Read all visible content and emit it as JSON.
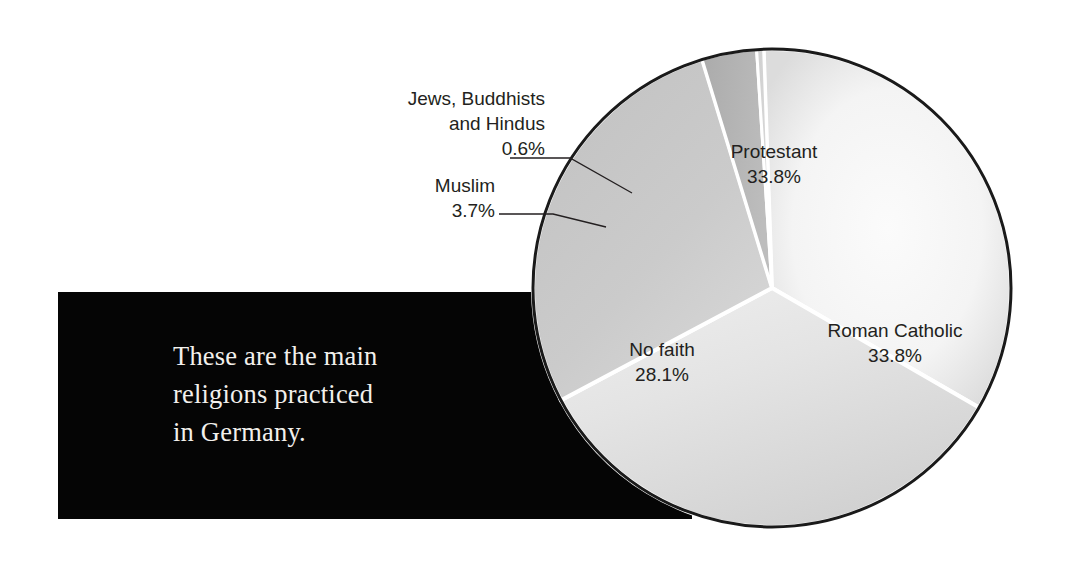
{
  "caption": {
    "line1": "These are the main",
    "line2": "religions practiced",
    "line3": "in Germany."
  },
  "chart_data": {
    "type": "pie",
    "title": "",
    "unit": "%",
    "categories": [
      "Protestant",
      "Roman Catholic",
      "No faith",
      "Muslim",
      "Jews, Buddhists and Hindus"
    ],
    "values": [
      33.8,
      33.8,
      28.1,
      3.7,
      0.6
    ],
    "legend": "none",
    "labels_inline": true,
    "slices": [
      {
        "name": "Protestant",
        "label": "Protestant",
        "value": 33.8,
        "value_text": "33.8%",
        "color": "#f3f3f3",
        "start_angle": -92,
        "end_angle": 30,
        "label_placement": "inside"
      },
      {
        "name": "Roman Catholic",
        "label": "Roman Catholic",
        "value": 33.8,
        "value_text": "33.8%",
        "color": "#e2e2e2",
        "start_angle": 30,
        "end_angle": 152,
        "label_placement": "inside"
      },
      {
        "name": "No faith",
        "label": "No faith",
        "value": 28.1,
        "value_text": "28.1%",
        "color": "#c9c9c9",
        "start_angle": 152,
        "end_angle": 253,
        "label_placement": "inside"
      },
      {
        "name": "Muslim",
        "label": "Muslim",
        "value": 3.7,
        "value_text": "3.7%",
        "color": "#b4b4b4",
        "start_angle": 253,
        "end_angle": 266.3,
        "label_placement": "callout"
      },
      {
        "name": "Jews, Buddhists and Hindus",
        "label_line1": "Jews, Buddhists",
        "label_line2": "and Hindus",
        "value": 0.6,
        "value_text": "0.6%",
        "color": "#d4d4d4",
        "start_angle": 266.3,
        "end_angle": 268,
        "label_placement": "callout"
      }
    ]
  },
  "colors": {
    "background": "#ffffff",
    "caption_box": "#050505",
    "caption_text": "#f2f0ec",
    "label_text": "#231f20",
    "pie_outline": "#1a1a1a",
    "slice_divider": "#ffffff",
    "leader_line": "#231f20"
  }
}
